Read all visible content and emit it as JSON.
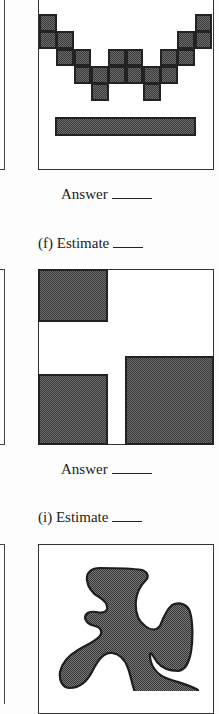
{
  "colors": {
    "fill": "#5a5a5a",
    "outline": "#222222",
    "frame": "#333333",
    "background": "#ffffff"
  },
  "problem_e": {
    "grid": {
      "cell_size_px": 17.3,
      "columns": 10,
      "rows": 5,
      "filled_cells": [
        [
          0,
          0
        ],
        [
          0,
          9
        ],
        [
          1,
          0
        ],
        [
          1,
          1
        ],
        [
          1,
          8
        ],
        [
          1,
          9
        ],
        [
          2,
          1
        ],
        [
          2,
          2
        ],
        [
          2,
          4
        ],
        [
          2,
          5
        ],
        [
          2,
          7
        ],
        [
          2,
          8
        ],
        [
          3,
          2
        ],
        [
          3,
          3
        ],
        [
          3,
          4
        ],
        [
          3,
          5
        ],
        [
          3,
          6
        ],
        [
          3,
          7
        ],
        [
          4,
          3
        ],
        [
          4,
          6
        ]
      ]
    },
    "bar": "horizontal-rectangle",
    "answer_label": "Answer"
  },
  "problem_f": {
    "label": "(f) Estimate",
    "shapes": [
      "top-left-rectangle",
      "bottom-left-square",
      "bottom-right-square"
    ],
    "answer_label": "Answer"
  },
  "problem_i": {
    "label": "(i) Estimate",
    "shape": "irregular-blob"
  }
}
